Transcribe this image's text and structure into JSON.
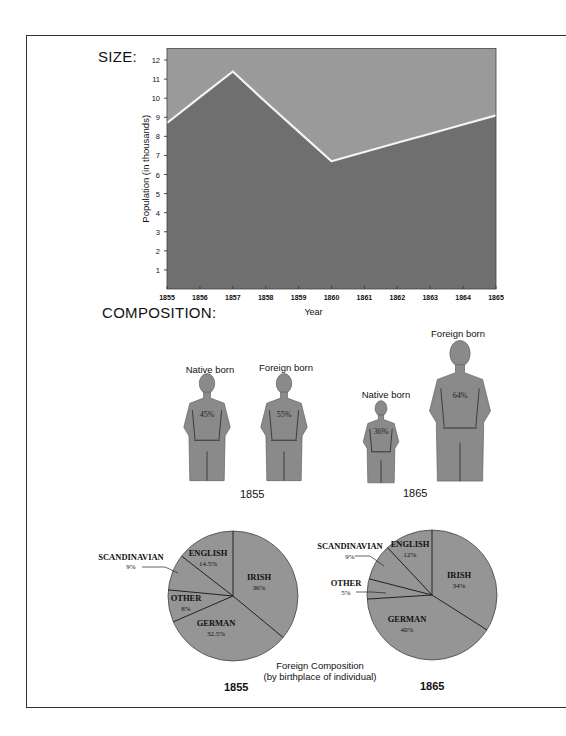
{
  "headings": {
    "size": "SIZE:",
    "composition": "COMPOSITION:"
  },
  "chart_data": [
    {
      "type": "area",
      "title": "SIZE:",
      "xlabel": "Year",
      "ylabel": "Population (in thousands)",
      "x": [
        1855,
        1856,
        1857,
        1858,
        1859,
        1860,
        1861,
        1862,
        1863,
        1864,
        1865
      ],
      "series": [
        {
          "name": "Population",
          "values": [
            8.7,
            10.05,
            11.4,
            9.8,
            8.25,
            6.7,
            7.18,
            7.66,
            8.14,
            8.62,
            9.1
          ]
        }
      ],
      "xticks": [
        "1855",
        "1856",
        "1857",
        "1858",
        "1859",
        "1860",
        "1861",
        "1862",
        "1863",
        "1864",
        "1865"
      ],
      "yticks": [
        "1",
        "2",
        "3",
        "4",
        "5",
        "6",
        "7",
        "8",
        "9",
        "10",
        "11",
        "12"
      ],
      "ylim": [
        0,
        12.6
      ],
      "xlim": [
        1855,
        1865
      ],
      "grid": false,
      "colors": {
        "area": "#6f6f6f",
        "background": "#9a9a9a",
        "line": "#f4f4f4"
      }
    },
    {
      "type": "pictogram",
      "title": "COMPOSITION:",
      "groups": [
        {
          "year": "1855",
          "figures": [
            {
              "label": "Native born",
              "value": "45%"
            },
            {
              "label": "Foreign born",
              "value": "55%"
            }
          ]
        },
        {
          "year": "1865",
          "figures": [
            {
              "label": "Native born",
              "value": "36%"
            },
            {
              "label": "Foreign born",
              "value": "64%"
            }
          ]
        }
      ]
    },
    {
      "type": "pie",
      "title": "Foreign Composition",
      "subtitle": "(by birthplace of individual)",
      "year": "1855",
      "slices": [
        {
          "label": "IRISH",
          "value": 36,
          "display": "36%"
        },
        {
          "label": "GERMAN",
          "value": 32.5,
          "display": "32.5%"
        },
        {
          "label": "OTHER",
          "value": 8,
          "display": "8%"
        },
        {
          "label": "SCANDINAVIAN",
          "value": 9,
          "display": "9%"
        },
        {
          "label": "ENGLISH",
          "value": 14.5,
          "display": "14.5%"
        }
      ]
    },
    {
      "type": "pie",
      "title": "Foreign Composition",
      "subtitle": "(by birthplace of individual)",
      "year": "1865",
      "slices": [
        {
          "label": "IRISH",
          "value": 34,
          "display": "34%"
        },
        {
          "label": "GERMAN",
          "value": 40,
          "display": "40%"
        },
        {
          "label": "OTHER",
          "value": 5,
          "display": "5%"
        },
        {
          "label": "SCANDINAVIAN",
          "value": 9,
          "display": "9%"
        },
        {
          "label": "ENGLISH",
          "value": 12,
          "display": "12%"
        }
      ]
    }
  ],
  "pie_caption": {
    "line1": "Foreign Composition",
    "line2": "(by birthplace of individual)"
  },
  "colors": {
    "figure_fill": "#8a8a8a",
    "pie_fill": "#959595",
    "ink": "#111111"
  }
}
